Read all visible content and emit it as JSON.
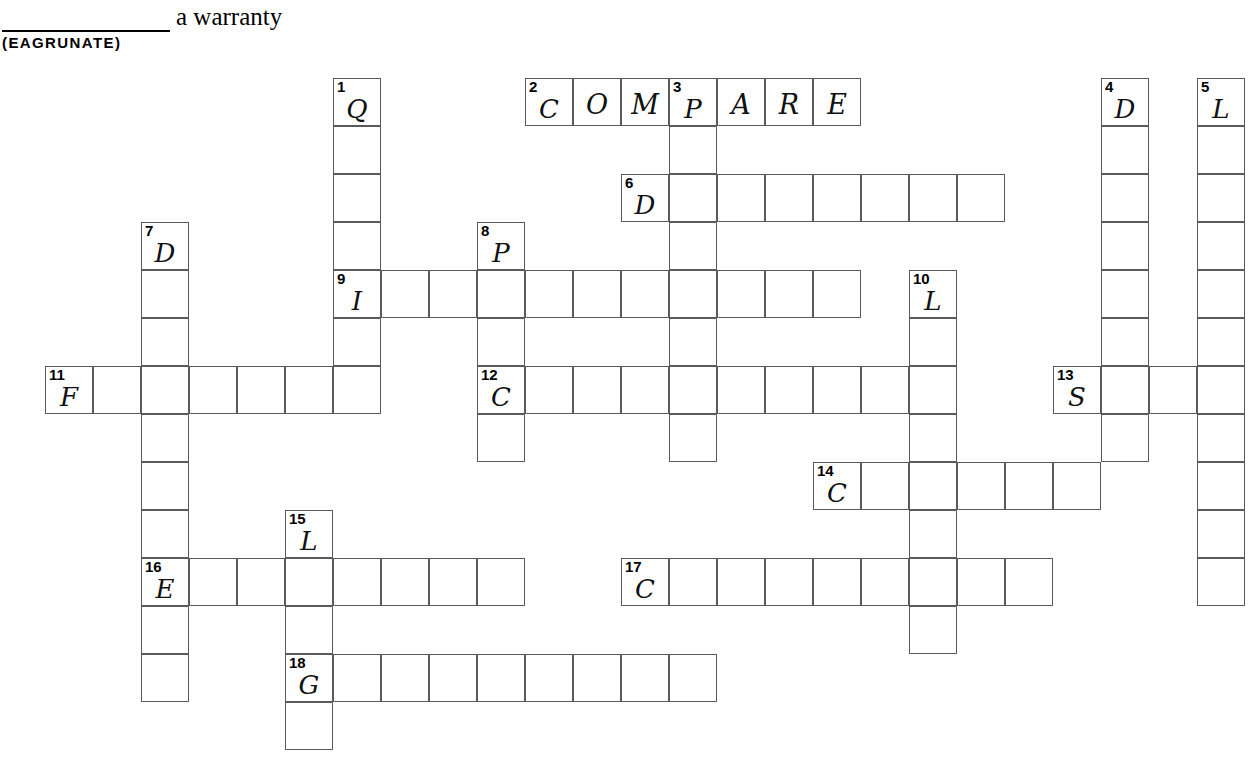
{
  "header": {
    "clue_text": "a warranty",
    "anagram": "(EAGRUNATE)",
    "blank_label": "blank-answer-line"
  },
  "grid": {
    "cell_size": 48,
    "origin_x": 45,
    "origin_y": 78,
    "cols": 25,
    "rows": 14,
    "border_color": "#5a5a5a",
    "background": "#ffffff"
  },
  "entries": [
    {
      "number": "1",
      "direction": "down",
      "col": 6,
      "row": 0,
      "length": 7,
      "letter": "Q"
    },
    {
      "number": "2",
      "direction": "across",
      "col": 10,
      "row": 0,
      "length": 7,
      "letter": "C"
    },
    {
      "number": "3",
      "direction": "down",
      "col": 13,
      "row": 0,
      "length": 8,
      "letter": "P"
    },
    {
      "number": "4",
      "direction": "down",
      "col": 22,
      "row": 0,
      "length": 8,
      "letter": "D"
    },
    {
      "number": "5",
      "direction": "down",
      "col": 24,
      "row": 0,
      "length": 11,
      "letter": "L"
    },
    {
      "number": "6",
      "direction": "across",
      "col": 12,
      "row": 2,
      "length": 8,
      "letter": "D"
    },
    {
      "number": "7",
      "direction": "down",
      "col": 2,
      "row": 3,
      "length": 10,
      "letter": "D"
    },
    {
      "number": "8",
      "direction": "down",
      "col": 9,
      "row": 3,
      "length": 5,
      "letter": "P"
    },
    {
      "number": "9",
      "direction": "across",
      "col": 6,
      "row": 4,
      "length": 11,
      "letter": "I"
    },
    {
      "number": "10",
      "direction": "down",
      "col": 18,
      "row": 4,
      "length": 8,
      "letter": "L"
    },
    {
      "number": "11",
      "direction": "across",
      "col": 0,
      "row": 6,
      "length": 7,
      "letter": "F"
    },
    {
      "number": "12",
      "direction": "across",
      "col": 9,
      "row": 6,
      "length": 9,
      "letter": "C"
    },
    {
      "number": "13",
      "direction": "across",
      "col": 21,
      "row": 6,
      "length": 4,
      "letter": "S"
    },
    {
      "number": "14",
      "direction": "across",
      "col": 16,
      "row": 8,
      "length": 6,
      "letter": "C"
    },
    {
      "number": "15",
      "direction": "down",
      "col": 5,
      "row": 9,
      "length": 5,
      "letter": "L"
    },
    {
      "number": "16",
      "direction": "across",
      "col": 2,
      "row": 10,
      "length": 8,
      "letter": "E"
    },
    {
      "number": "17",
      "direction": "across",
      "col": 12,
      "row": 10,
      "length": 9,
      "letter": "C"
    },
    {
      "number": "18",
      "direction": "across",
      "col": 5,
      "row": 12,
      "length": 9,
      "letter": "G"
    }
  ],
  "prefilled_answers": [
    {
      "number": "2",
      "direction": "across",
      "letters": [
        "C",
        "O",
        "M",
        "P",
        "A",
        "R",
        "E"
      ]
    }
  ]
}
